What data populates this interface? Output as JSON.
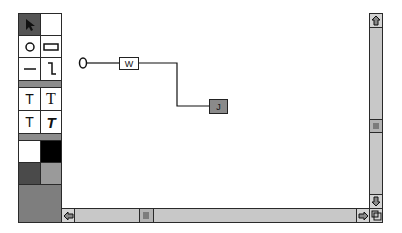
{
  "palette": {
    "tools": [
      {
        "name": "arrow-tool",
        "icon": "arrow-pointer-icon",
        "selected": true
      },
      {
        "name": "blank-tool",
        "icon": "",
        "selected": false
      },
      {
        "name": "oval-tool",
        "icon": "circle-icon",
        "selected": false
      },
      {
        "name": "rectangle-tool",
        "icon": "rectangle-icon",
        "selected": false
      },
      {
        "name": "line-tool",
        "icon": "line-icon",
        "selected": false
      },
      {
        "name": "connector-tool",
        "icon": "elbow-connector-icon",
        "selected": false
      }
    ],
    "text_styles": [
      {
        "name": "text-sans",
        "label": "T"
      },
      {
        "name": "text-serif",
        "label": "T"
      },
      {
        "name": "text-sans-small",
        "label": "T"
      },
      {
        "name": "text-bold-italic",
        "label": "T"
      }
    ],
    "colors": {
      "white": "#ffffff",
      "black": "#000000",
      "dark_gray": "#4a4a4a",
      "mid_gray": "#9a9a9a",
      "current_fill": "#7e7e7e"
    }
  },
  "diagram": {
    "start_node": {
      "shape": "circle"
    },
    "nodes": [
      {
        "id": "w",
        "label": "W",
        "fill": "#ffffff"
      },
      {
        "id": "j",
        "label": "J",
        "fill": "#8a8a8a"
      }
    ]
  },
  "scrollbars": {
    "vertical": {
      "up_icon": "arrow-up-icon",
      "down_icon": "arrow-down-icon"
    },
    "horizontal": {
      "left_icon": "arrow-left-icon",
      "right_icon": "arrow-right-icon"
    },
    "grow_box_icon": "resize-grow-icon"
  }
}
